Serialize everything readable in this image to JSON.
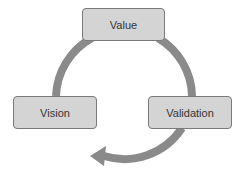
{
  "diagram": {
    "type": "cycle",
    "nodes": [
      {
        "id": "value",
        "label": "Value"
      },
      {
        "id": "validation",
        "label": "Validation"
      },
      {
        "id": "vision",
        "label": "Vision"
      }
    ],
    "edges": [
      {
        "from": "vision",
        "to": "value"
      },
      {
        "from": "value",
        "to": "validation"
      },
      {
        "from": "validation",
        "to": "vision",
        "arrowhead": true
      }
    ],
    "colors": {
      "box_fill": "#d4d4d4",
      "box_border": "#7a7a7a",
      "arrow": "#8a8a8a",
      "text": "#333333"
    }
  }
}
